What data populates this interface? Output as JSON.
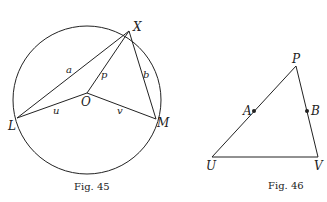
{
  "figures": [
    {
      "caption": "Fig. 45",
      "points": {
        "X": "X",
        "L": "L",
        "M": "M",
        "O": "O"
      },
      "segments": {
        "a": "a",
        "b": "b",
        "p": "p",
        "u": "u",
        "v": "v"
      }
    },
    {
      "caption": "Fig. 46",
      "points": {
        "P": "P",
        "A": "A",
        "B": "B",
        "U": "U",
        "V": "V"
      }
    }
  ]
}
